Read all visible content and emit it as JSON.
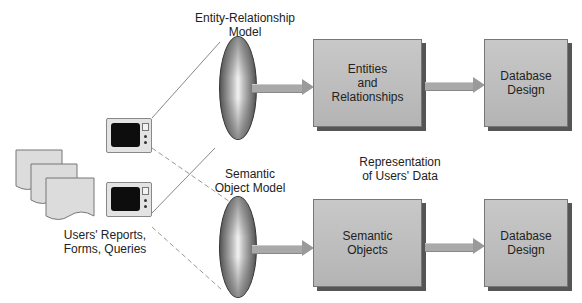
{
  "diagram": {
    "top_lens_label_line1": "Entity-Relationship",
    "top_lens_label_line2": "Model",
    "bottom_lens_label_line1": "Semantic",
    "bottom_lens_label_line2": "Object Model",
    "source_label_line1": "Users' Reports,",
    "source_label_line2": "Forms, Queries",
    "middle_label_line1": "Representation",
    "middle_label_line2": "of Users' Data",
    "top_row": {
      "box1_line1": "Entities",
      "box1_line2": "and",
      "box1_line3": "Relationships",
      "box2_line1": "Database",
      "box2_line2": "Design"
    },
    "bottom_row": {
      "box1_line1": "Semantic",
      "box1_line2": "Objects",
      "box2_line1": "Database",
      "box2_line2": "Design"
    },
    "colors": {
      "box_fill": "#bdbdbd",
      "box_shadow": "#555555",
      "arrow_fill": "#a9a9a9",
      "line": "#888888"
    }
  }
}
